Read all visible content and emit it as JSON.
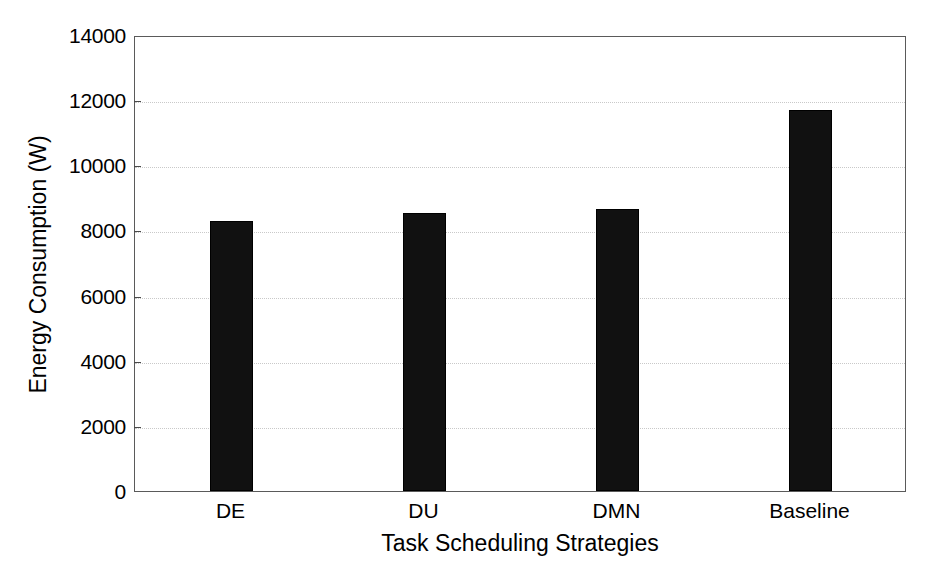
{
  "chart_data": {
    "type": "bar",
    "title": "",
    "xlabel": "Task Scheduling Strategies",
    "ylabel": "Energy Consumption (W)",
    "categories": [
      "DE",
      "DU",
      "DMN",
      "Baseline"
    ],
    "values": [
      8300,
      8550,
      8650,
      11700
    ],
    "ylim": [
      0,
      14000
    ],
    "yticks": [
      0,
      2000,
      4000,
      6000,
      8000,
      10000,
      12000,
      14000
    ],
    "ytick_labels": [
      "0",
      "2000",
      "4000",
      "6000",
      "8000",
      "10000",
      "12000",
      "14000"
    ],
    "grid": "horizontal-dotted",
    "legend": null,
    "bar_color": "#111111",
    "axis_color": "#5a5a5a",
    "grid_color": "#c9c9c9",
    "background": "#ffffff",
    "series": [
      {
        "name": "Energy Consumption",
        "values": [
          8300,
          8550,
          8650,
          11700
        ]
      }
    ]
  }
}
